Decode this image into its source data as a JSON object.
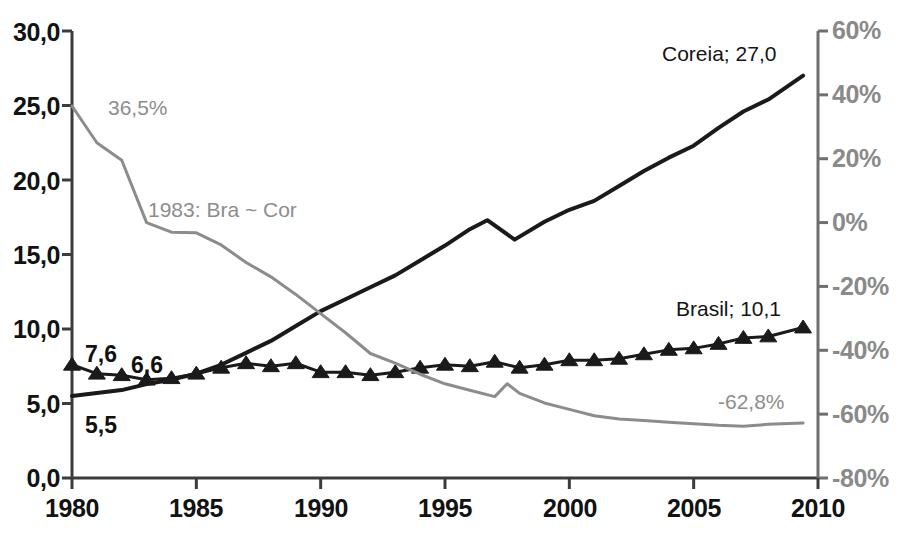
{
  "chart_data": {
    "type": "line",
    "title": "",
    "subtitle": "",
    "xlabel": "",
    "ylabel": "",
    "y2label": "",
    "xlim": [
      1980,
      2010
    ],
    "ylim": [
      0.0,
      30.0
    ],
    "y2lim": [
      -80,
      60
    ],
    "grid": false,
    "legend_position": "inline-annotations",
    "x_ticks": [
      "1980",
      "1985",
      "1990",
      "1995",
      "2000",
      "2005",
      "2010"
    ],
    "x_tick_values": [
      1980,
      1985,
      1990,
      1995,
      2000,
      2005,
      2010
    ],
    "y_ticks": [
      "0,0",
      "5,0",
      "10,0",
      "15,0",
      "20,0",
      "25,0",
      "30,0"
    ],
    "y_tick_values": [
      0.0,
      5.0,
      10.0,
      15.0,
      20.0,
      25.0,
      30.0
    ],
    "y2_ticks": [
      "-80%",
      "-60%",
      "-40%",
      "-20%",
      "0%",
      "20%",
      "40%",
      "60%"
    ],
    "y2_tick_values": [
      -80,
      -60,
      -40,
      -20,
      0,
      20,
      40,
      60
    ],
    "series": [
      {
        "name": "Coreia",
        "axis": "left",
        "color": "#1a1a1a",
        "marker": "none",
        "line_width": 4,
        "x": [
          1980,
          1981,
          1982,
          1983,
          1984,
          1985,
          1986,
          1987,
          1988,
          1989,
          1990,
          1991,
          1992,
          1993,
          1994,
          1995,
          1996,
          1996.7,
          1997.8,
          1999,
          2000,
          2001,
          2002,
          2003,
          2004,
          2005,
          2006,
          2007,
          2008,
          2009.4
        ],
        "values": [
          5.5,
          5.7,
          5.9,
          6.3,
          6.6,
          7.0,
          7.6,
          8.4,
          9.2,
          10.2,
          11.2,
          12.0,
          12.8,
          13.6,
          14.6,
          15.6,
          16.7,
          17.3,
          16.0,
          17.2,
          18.0,
          18.6,
          19.6,
          20.6,
          21.5,
          22.3,
          23.5,
          24.6,
          25.4,
          27.0
        ]
      },
      {
        "name": "Brasil",
        "axis": "left",
        "color": "#1a1a1a",
        "marker": "triangle",
        "line_width": 3,
        "x": [
          1980,
          1981,
          1982,
          1983,
          1984,
          1985,
          1986,
          1987,
          1988,
          1989,
          1990,
          1991,
          1992,
          1993,
          1994,
          1995,
          1996,
          1997,
          1998,
          1999,
          2000,
          2001,
          2002,
          2003,
          2004,
          2005,
          2006,
          2007,
          2008,
          2009.4
        ],
        "values": [
          7.6,
          7.0,
          6.9,
          6.6,
          6.7,
          7.0,
          7.4,
          7.7,
          7.5,
          7.7,
          7.1,
          7.1,
          6.9,
          7.1,
          7.4,
          7.6,
          7.5,
          7.8,
          7.4,
          7.6,
          7.9,
          7.9,
          8.0,
          8.3,
          8.6,
          8.7,
          9.0,
          9.4,
          9.5,
          10.1
        ]
      },
      {
        "name": "Diferenca",
        "axis": "right",
        "color": "#8c8c8c",
        "marker": "none",
        "line_width": 3,
        "x": [
          1980,
          1981,
          1982,
          1983,
          1984,
          1985,
          1986,
          1987,
          1988,
          1989,
          1990,
          1991,
          1992,
          1993,
          1994,
          1995,
          1996,
          1997,
          1997.5,
          1998,
          1999,
          2000,
          2001,
          2002,
          2003,
          2004,
          2005,
          2006,
          2007,
          2008,
          2009.4
        ],
        "values": [
          36.5,
          25.0,
          19.5,
          0.0,
          -3.0,
          -3.2,
          -7.0,
          -12.5,
          -17.0,
          -22.5,
          -28.5,
          -34.5,
          -41.0,
          -44.0,
          -47.5,
          -50.5,
          -52.5,
          -54.5,
          -50.5,
          -53.5,
          -56.5,
          -58.5,
          -60.5,
          -61.5,
          -62.0,
          -62.5,
          -63.0,
          -63.5,
          -63.8,
          -63.2,
          -62.8
        ]
      }
    ],
    "annotations": [
      {
        "id": "pct-start",
        "text": "36,5%",
        "style": "muted"
      },
      {
        "id": "crossover-note",
        "text": "1983: Bra ~ Cor",
        "style": "muted"
      },
      {
        "id": "pct-end",
        "text": "-62,8%",
        "style": "muted"
      },
      {
        "id": "coreia-label",
        "text": "Coreia; 27,0",
        "style": "normal"
      },
      {
        "id": "brasil-label",
        "text": "Brasil; 10,1",
        "style": "normal"
      },
      {
        "id": "brasil-start-value",
        "text": "7,6",
        "style": "bold"
      },
      {
        "id": "brasil-min-value",
        "text": "6,6",
        "style": "bold"
      },
      {
        "id": "coreia-start-value",
        "text": "5,5",
        "style": "bold"
      }
    ]
  }
}
